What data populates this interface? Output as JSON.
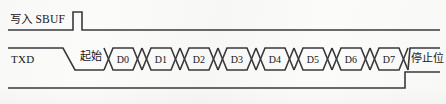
{
  "figure": {
    "background_color": "#fbfbfa",
    "line_color": "#3a3a3e"
  },
  "rows": [
    {
      "name": "write-sbuf",
      "label": "写入 SBUF",
      "signal": "pulse",
      "baseline_y": 30,
      "high_y": 12,
      "pulse_start_x": 73,
      "pulse_end_x": 82
    },
    {
      "name": "txd",
      "label": "TXD",
      "signal": "serial-frame",
      "idle_y": 48,
      "low_y": 70,
      "fall_start_x": 63,
      "fall_end_x": 75,
      "rise_start_x": 399,
      "rise_end_x": 410
    },
    {
      "name": "ti",
      "label": "",
      "signal": "step",
      "low_y": 88,
      "high_y": 72,
      "rise_x": 405
    }
  ],
  "annotations": {
    "start_bit": "起始",
    "stop_bit": "停止位"
  },
  "data_cells": [
    {
      "label": "D0",
      "center_x": 123
    },
    {
      "label": "D1",
      "center_x": 161
    },
    {
      "label": "D2",
      "center_x": 199
    },
    {
      "label": "D3",
      "center_x": 237
    },
    {
      "label": "D4",
      "center_x": 275
    },
    {
      "label": "D5",
      "center_x": 313
    },
    {
      "label": "D6",
      "center_x": 351
    },
    {
      "label": "D7",
      "center_x": 389
    }
  ],
  "geometry": {
    "line_left_x": 8,
    "line_right_x": 440,
    "cell_top_y": 48,
    "cell_bottom_y": 70,
    "cell_width": 38,
    "cell_skew": 9,
    "first_cell_left_x": 104
  }
}
